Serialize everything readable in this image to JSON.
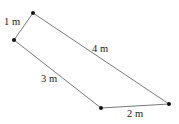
{
  "diagram": {
    "type": "quadrilateral",
    "vertices": [
      {
        "id": "A",
        "x": 33,
        "y": 13
      },
      {
        "id": "B",
        "x": 14,
        "y": 40
      },
      {
        "id": "C",
        "x": 101,
        "y": 108
      },
      {
        "id": "D",
        "x": 169,
        "y": 104
      }
    ],
    "edges": [
      {
        "from": "A",
        "to": "B",
        "label": "1 m",
        "label_x": 4,
        "label_y": 25
      },
      {
        "from": "B",
        "to": "C",
        "label": "3 m",
        "label_x": 41,
        "label_y": 82
      },
      {
        "from": "C",
        "to": "D",
        "label": "2 m",
        "label_x": 127,
        "label_y": 117
      },
      {
        "from": "D",
        "to": "A",
        "label": "4 m",
        "label_x": 92,
        "label_y": 52
      }
    ],
    "colors": {
      "line": "#555555",
      "vertex": "#111111",
      "text": "#222222"
    }
  }
}
